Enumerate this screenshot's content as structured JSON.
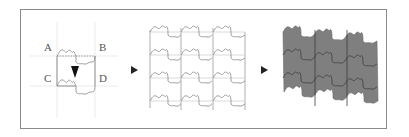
{
  "diagram": {
    "step1": {
      "labels": {
        "A": "A",
        "B": "B",
        "C": "C",
        "D": "D"
      },
      "arrow": "down-arrow"
    },
    "step2": {
      "rows": 4,
      "cols": 3
    },
    "step3": {
      "fill_color": "#808080",
      "line_color": "#4a4a4a"
    },
    "arrows": [
      "right-arrow",
      "right-arrow"
    ],
    "colors": {
      "frame": "#8a8a8a",
      "guide": "#e3e3e3",
      "outline": "#8a8a8a",
      "fill": "#808080",
      "arrow": "#222222"
    }
  }
}
